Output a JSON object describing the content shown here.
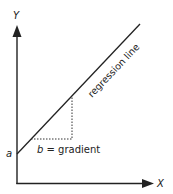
{
  "diagram": {
    "axis_y_label": "Y",
    "axis_x_label": "X",
    "intercept_label": "a",
    "line_label": "regression line",
    "gradient_label_var": "b",
    "gradient_label_rest": " = gradient",
    "colors": {
      "line": "#222222",
      "dotted": "#333333",
      "text": "#222222"
    }
  }
}
